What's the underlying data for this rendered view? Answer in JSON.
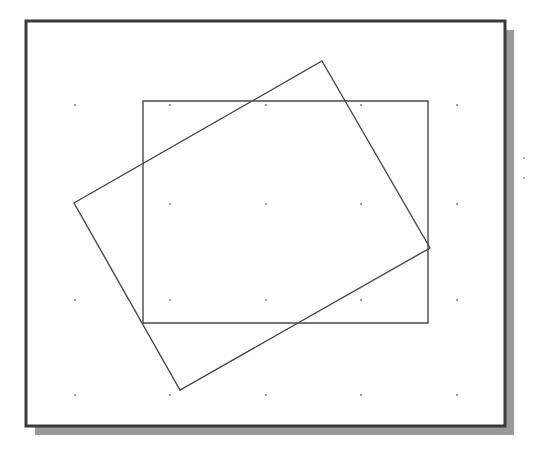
{
  "page": {
    "kind": "scanned-geometry-figure",
    "width": 534,
    "height": 456,
    "background_color": "#ffffff",
    "paper_color": "#fefefe",
    "caption": ""
  },
  "frame": {
    "name": "outer-frame",
    "label": "Figure frame",
    "x": 26,
    "y": 21,
    "width": 479,
    "height": 405,
    "border_color": "#3a3a3a",
    "border_width": 3,
    "fill": "#fefefe"
  },
  "shadow": {
    "name": "drop-shadow",
    "label": "Drop shadow",
    "offset_x": 9,
    "offset_y": 9,
    "color": "#9a9a9a"
  },
  "shapes": [
    {
      "name": "axis-aligned-rectangle",
      "label": "Upright rectangle",
      "type": "rectangle",
      "stroke_color": "#4a4a4a",
      "stroke_width": 1.4,
      "fill": "none",
      "rotation_deg": 0,
      "points": [
        {
          "x": 143,
          "y": 101
        },
        {
          "x": 428,
          "y": 101
        },
        {
          "x": 428,
          "y": 323
        },
        {
          "x": 143,
          "y": 323
        }
      ]
    },
    {
      "name": "rotated-rectangle",
      "label": "Tilted rectangle",
      "type": "rectangle",
      "stroke_color": "#4a4a4a",
      "stroke_width": 1.4,
      "fill": "none",
      "rotation_deg": -22,
      "points": [
        {
          "x": 322,
          "y": 61
        },
        {
          "x": 430,
          "y": 248
        },
        {
          "x": 180,
          "y": 390
        },
        {
          "x": 74,
          "y": 203
        }
      ]
    }
  ],
  "dot_grid": {
    "name": "dot-grid",
    "label": "Grid reference dots",
    "color": "#8a8a8a",
    "radius": 1.1,
    "columns_x": [
      75,
      170,
      266,
      361,
      457
    ],
    "rows_y": [
      105,
      204,
      300,
      395
    ],
    "omitted": [
      {
        "col": 0,
        "row": 1
      }
    ]
  },
  "stray_marks": {
    "name": "stray-marks",
    "label": "Scan speckles outside frame",
    "color": "#9c9c9c",
    "points": [
      {
        "x": 524,
        "y": 158
      },
      {
        "x": 524,
        "y": 178
      }
    ]
  }
}
